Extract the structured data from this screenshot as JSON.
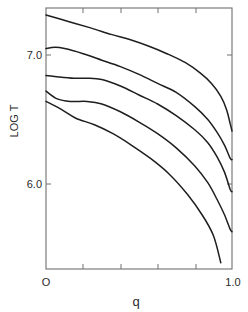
{
  "chart_data": {
    "type": "line",
    "title": "",
    "xlabel": "q",
    "ylabel": "LOG T",
    "xlim": [
      0.0,
      1.0
    ],
    "ylim": [
      5.35,
      7.37
    ],
    "x_ticks": [
      0.0,
      0.2,
      0.4,
      0.6,
      0.8,
      1.0
    ],
    "x_tick_labels": [
      "O",
      "",
      "",
      "",
      "",
      "1.0"
    ],
    "y_ticks": [
      6.0,
      7.0
    ],
    "y_tick_labels": [
      "6.0",
      "7.0"
    ],
    "grid": false,
    "legend": null,
    "series": [
      {
        "name": "curve-1",
        "x": [
          0.0,
          0.12,
          0.24,
          0.35,
          0.45,
          0.55,
          0.65,
          0.75,
          0.83,
          0.89,
          0.94,
          0.97,
          0.99,
          1.0
        ],
        "y": [
          7.31,
          7.26,
          7.21,
          7.16,
          7.12,
          7.07,
          7.01,
          6.94,
          6.86,
          6.78,
          6.68,
          6.58,
          6.47,
          6.41
        ]
      },
      {
        "name": "curve-2",
        "x": [
          0.0,
          0.05,
          0.1,
          0.2,
          0.3,
          0.4,
          0.5,
          0.6,
          0.7,
          0.8,
          0.87,
          0.92,
          0.96,
          0.99,
          1.0
        ],
        "y": [
          7.05,
          7.06,
          7.05,
          7.01,
          6.96,
          6.91,
          6.85,
          6.78,
          6.71,
          6.6,
          6.5,
          6.4,
          6.3,
          6.2,
          6.19
        ]
      },
      {
        "name": "curve-3",
        "x": [
          0.0,
          0.07,
          0.15,
          0.22,
          0.3,
          0.4,
          0.5,
          0.6,
          0.7,
          0.8,
          0.87,
          0.92,
          0.96,
          0.99,
          1.0
        ],
        "y": [
          6.84,
          6.83,
          6.82,
          6.82,
          6.81,
          6.76,
          6.69,
          6.62,
          6.53,
          6.42,
          6.32,
          6.21,
          6.09,
          5.96,
          5.94
        ]
      },
      {
        "name": "curve-4",
        "x": [
          0.0,
          0.06,
          0.13,
          0.22,
          0.3,
          0.4,
          0.5,
          0.6,
          0.7,
          0.8,
          0.87,
          0.92,
          0.96,
          0.99,
          1.0
        ],
        "y": [
          6.72,
          6.66,
          6.64,
          6.64,
          6.62,
          6.56,
          6.48,
          6.39,
          6.28,
          6.14,
          6.01,
          5.88,
          5.76,
          5.65,
          5.63
        ]
      },
      {
        "name": "curve-5",
        "x": [
          0.0,
          0.08,
          0.16,
          0.26,
          0.36,
          0.46,
          0.56,
          0.66,
          0.76,
          0.84,
          0.9,
          0.94
        ],
        "y": [
          6.64,
          6.58,
          6.51,
          6.46,
          6.39,
          6.3,
          6.2,
          6.08,
          5.92,
          5.76,
          5.6,
          5.39
        ]
      }
    ]
  },
  "labels": {
    "ylabel": "LOG T",
    "xlabel": "q",
    "y_tick_7": "7.0",
    "y_tick_6": "6.0",
    "x_tick_0": "O",
    "x_tick_1": "1.0"
  },
  "style": {
    "line_color": "#1e1e1e",
    "frame_color": "#707070",
    "text_color": "#2a2a2a"
  }
}
